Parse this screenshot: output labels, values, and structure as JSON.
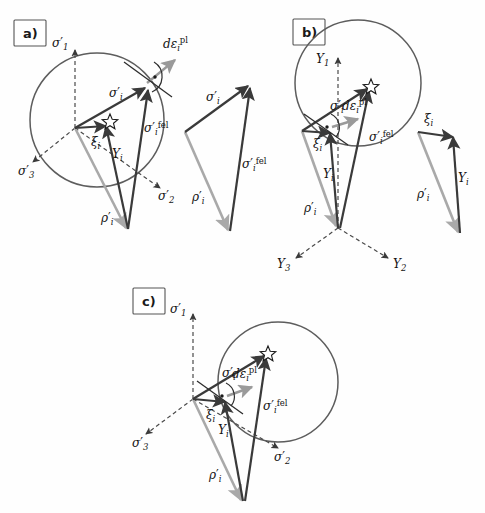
{
  "figure": {
    "width": 485,
    "height": 513,
    "background": "#fefefe"
  },
  "colors": {
    "yield_circle": "#5d5d5d",
    "axis_dashed": "#4a4a4a",
    "vector_dark": "#3a3a3a",
    "vector_light": "#a9a9a9",
    "vector_plastic": "#9a9a9a",
    "star_fill": "#ffffff",
    "star_stroke": "#1a1a1a",
    "label_text": "#141414",
    "panel_box_stroke": "#555555"
  },
  "symbols": {
    "sigma_eff": "σ′",
    "sigma_eff_i": "σ′i",
    "sigma_trial": "σ′i rfel",
    "rho": "ρ′i",
    "xi": "ξi",
    "Y": "Yi",
    "deps_pl": "dεi pl",
    "axis_s1": "σ′1",
    "axis_s2": "σ′2",
    "axis_s3": "σ′3",
    "axis_Y1": "Y1",
    "axis_Y2": "Y2",
    "axis_Y3": "Y3"
  },
  "panels": [
    {
      "id": "a",
      "label": "a)",
      "axis_system": "principal-effective-stress",
      "axes": [
        {
          "name": "sigma-1-axis",
          "label_base": "σ",
          "label_prime": "′",
          "label_sub": "1",
          "direction": "up"
        },
        {
          "name": "sigma-2-axis",
          "label_base": "σ",
          "label_prime": "′",
          "label_sub": "2",
          "direction": "down-right"
        },
        {
          "name": "sigma-3-axis",
          "label_base": "σ",
          "label_prime": "′",
          "label_sub": "3",
          "direction": "down-left"
        }
      ],
      "yield_surface": {
        "shape": "circle",
        "cx": 97,
        "cy": 120,
        "r": 67
      },
      "vectors": [
        {
          "name": "sigma-eff-vector",
          "label_base": "σ",
          "label_prime": "′",
          "label_sub": "i",
          "label_sup": "",
          "tone": "dark"
        },
        {
          "name": "sigma-trial-vector",
          "label_base": "σ",
          "label_prime": "′",
          "label_sub": "i",
          "label_sup": "fel",
          "tone": "dark"
        },
        {
          "name": "rho-vector",
          "label_base": "ρ",
          "label_prime": "′",
          "label_sub": "i",
          "label_sup": "",
          "tone": "light"
        },
        {
          "name": "xi-vector",
          "label_base": "ξ",
          "label_prime": "",
          "label_sub": "i",
          "label_sup": "",
          "tone": "dark"
        },
        {
          "name": "Y-vector",
          "label_base": "Y",
          "label_prime": "",
          "label_sub": "i",
          "label_sup": "",
          "tone": "dark"
        },
        {
          "name": "plastic-strain-increment-vector",
          "label_base": "dε",
          "label_prime": "",
          "label_sub": "i",
          "label_sup": "pl",
          "tone": "plastic"
        }
      ],
      "has_detached_triangle": true,
      "detached_triangle_vectors": [
        "sigma-eff-vector",
        "sigma-trial-vector",
        "rho-vector"
      ],
      "has_right_angle_marker": true,
      "has_star_marker": true
    },
    {
      "id": "b",
      "label": "b)",
      "axis_system": "relative-stress-Y",
      "axes": [
        {
          "name": "Y1-axis",
          "label_base": "Y",
          "label_prime": "",
          "label_sub": "1",
          "direction": "up"
        },
        {
          "name": "Y2-axis",
          "label_base": "Y",
          "label_prime": "",
          "label_sub": "2",
          "direction": "down-right"
        },
        {
          "name": "Y3-axis",
          "label_base": "Y",
          "label_prime": "",
          "label_sub": "3",
          "direction": "down-left"
        }
      ],
      "yield_surface": {
        "shape": "circle",
        "cx": 358,
        "cy": 83,
        "r": 63
      },
      "vectors": [
        {
          "name": "sigma-eff-vector",
          "label_base": "σ",
          "label_prime": "′",
          "label_sub": "i",
          "label_sup": "",
          "tone": "dark"
        },
        {
          "name": "sigma-trial-vector",
          "label_base": "σ",
          "label_prime": "′",
          "label_sub": "i",
          "label_sup": "fel",
          "tone": "dark"
        },
        {
          "name": "rho-vector",
          "label_base": "ρ",
          "label_prime": "′",
          "label_sub": "i",
          "label_sup": "",
          "tone": "light"
        },
        {
          "name": "xi-vector",
          "label_base": "ξ",
          "label_prime": "",
          "label_sub": "i",
          "label_sup": "",
          "tone": "dark"
        },
        {
          "name": "Y-vector",
          "label_base": "Y",
          "label_prime": "",
          "label_sub": "i",
          "label_sup": "",
          "tone": "dark"
        },
        {
          "name": "plastic-strain-increment-vector",
          "label_base": "dε",
          "label_prime": "",
          "label_sub": "i",
          "label_sup": "pl",
          "tone": "plastic"
        }
      ],
      "has_detached_triangle": true,
      "detached_triangle_vectors": [
        "xi-vector",
        "Y-vector",
        "rho-vector"
      ],
      "has_right_angle_marker": true,
      "has_star_marker": true
    },
    {
      "id": "c",
      "label": "c)",
      "axis_system": "principal-effective-stress",
      "axes": [
        {
          "name": "sigma-1-axis",
          "label_base": "σ",
          "label_prime": "′",
          "label_sub": "1",
          "direction": "up"
        },
        {
          "name": "sigma-2-axis",
          "label_base": "σ",
          "label_prime": "′",
          "label_sub": "2",
          "direction": "down-right"
        },
        {
          "name": "sigma-3-axis",
          "label_base": "σ",
          "label_prime": "′",
          "label_sub": "3",
          "direction": "down-left"
        }
      ],
      "yield_surface": {
        "shape": "circle",
        "cx": 278,
        "cy": 382,
        "r": 60
      },
      "vectors": [
        {
          "name": "sigma-eff-vector",
          "label_base": "σ",
          "label_prime": "′",
          "label_sub": "i",
          "label_sup": "",
          "tone": "dark"
        },
        {
          "name": "sigma-trial-vector",
          "label_base": "σ",
          "label_prime": "′",
          "label_sub": "i",
          "label_sup": "fel",
          "tone": "dark"
        },
        {
          "name": "rho-vector",
          "label_base": "ρ",
          "label_prime": "′",
          "label_sub": "i",
          "label_sup": "",
          "tone": "light"
        },
        {
          "name": "xi-vector",
          "label_base": "ξ",
          "label_prime": "",
          "label_sub": "i",
          "label_sup": "",
          "tone": "dark"
        },
        {
          "name": "Y-vector",
          "label_base": "Y",
          "label_prime": "",
          "label_sub": "i",
          "label_sup": "",
          "tone": "dark"
        },
        {
          "name": "plastic-strain-increment-vector",
          "label_base": "dε",
          "label_prime": "",
          "label_sub": "i",
          "label_sup": "pl",
          "tone": "plastic"
        }
      ],
      "has_detached_triangle": false,
      "detached_triangle_vectors": [],
      "has_right_angle_marker": true,
      "has_star_marker": true
    }
  ]
}
